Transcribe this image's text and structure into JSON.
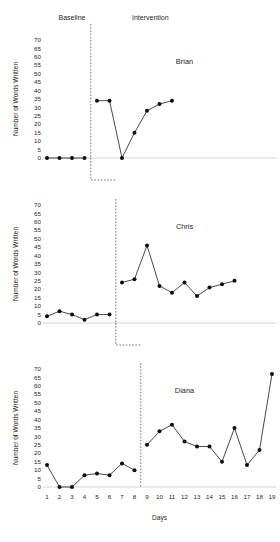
{
  "chart_data": {
    "type": "line",
    "title": "",
    "xlabel": "Days",
    "ylabel": "Number of Words Written",
    "x": [
      1,
      2,
      3,
      4,
      5,
      6,
      7,
      8,
      9,
      10,
      11,
      12,
      13,
      14,
      15,
      16,
      17,
      18,
      19
    ],
    "xlim": [
      1,
      19
    ],
    "ylim": [
      0,
      70
    ],
    "yticks": [
      0,
      5,
      10,
      15,
      20,
      25,
      30,
      35,
      40,
      45,
      50,
      55,
      60,
      65,
      70
    ],
    "ytick_labels": [
      "0",
      "5",
      "10",
      "15",
      "20",
      "25",
      "30",
      "35",
      "40",
      "45",
      "50",
      "55",
      "60",
      "65",
      "70"
    ],
    "xtick_labels": [
      "1",
      "2",
      "3",
      "4",
      "5",
      "6",
      "7",
      "8",
      "9",
      "10",
      "11",
      "12",
      "13",
      "14",
      "15",
      "16",
      "17",
      "18",
      "19"
    ],
    "grid": false,
    "legend": "none",
    "design": "multiple-baseline-across-participants",
    "phase_labels": [
      {
        "name": "Baseline",
        "text": "Baseline"
      },
      {
        "name": "Intervention",
        "text": "Intervention"
      }
    ],
    "panels": [
      {
        "name": "Brian",
        "label": "Brian",
        "phase_change_after_day": 4,
        "series": [
          {
            "name": "Baseline",
            "x": [
              1,
              2,
              3,
              4
            ],
            "values": [
              0,
              0,
              0,
              0
            ]
          },
          {
            "name": "Intervention",
            "x": [
              5,
              6,
              7,
              8,
              9,
              10,
              11
            ],
            "values": [
              34,
              34,
              0,
              15,
              28,
              32,
              34
            ]
          }
        ]
      },
      {
        "name": "Chris",
        "label": "Chris",
        "phase_change_after_day": 6,
        "series": [
          {
            "name": "Baseline",
            "x": [
              1,
              2,
              3,
              4,
              5,
              6
            ],
            "values": [
              4,
              7,
              5,
              2,
              5,
              5
            ]
          },
          {
            "name": "Intervention",
            "x": [
              7,
              8,
              9,
              10,
              11,
              12,
              13,
              14,
              15,
              16
            ],
            "values": [
              24,
              26,
              46,
              22,
              18,
              24,
              16,
              21,
              23,
              25
            ]
          }
        ]
      },
      {
        "name": "Diana",
        "label": "Diana",
        "phase_change_after_day": 8,
        "series": [
          {
            "name": "Baseline",
            "x": [
              1,
              2,
              3,
              4,
              5,
              6,
              7,
              8
            ],
            "values": [
              13,
              0,
              0,
              7,
              8,
              7,
              14,
              10
            ]
          },
          {
            "name": "Intervention",
            "x": [
              9,
              10,
              11,
              12,
              13,
              14,
              15,
              16,
              17,
              18,
              19
            ],
            "values": [
              25,
              33,
              37,
              27,
              24,
              24,
              15,
              35,
              13,
              22,
              67
            ]
          }
        ]
      }
    ],
    "colors": {
      "line": "#1a1a1a",
      "marker": "#0d0d0d",
      "axis": "#c8c8c8",
      "phase_line": "#555555",
      "text": "#262626",
      "background": "#ffffff"
    }
  }
}
